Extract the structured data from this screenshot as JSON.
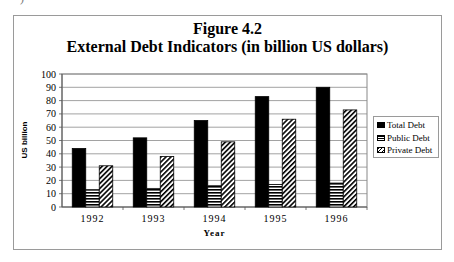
{
  "page": {
    "stray_text": ")"
  },
  "chart_data": {
    "type": "bar",
    "title": "Figure 4.2",
    "subtitle": "External Debt Indicators (in billion US dollars)",
    "xlabel": "Year",
    "ylabel": "US billion",
    "categories": [
      "1992",
      "1993",
      "1994",
      "1995",
      "1996"
    ],
    "series": [
      {
        "name": "Total Debt",
        "values": [
          44,
          52,
          65,
          83,
          90
        ],
        "pattern": "solid-black"
      },
      {
        "name": "Public Debt",
        "values": [
          13,
          14,
          16,
          17,
          18
        ],
        "pattern": "horizontal-stripes"
      },
      {
        "name": "Private Debt",
        "values": [
          31,
          38,
          49,
          66,
          73
        ],
        "pattern": "diagonal-stripes"
      }
    ],
    "ylim": [
      0,
      100
    ],
    "yticks": [
      0,
      10,
      20,
      30,
      40,
      50,
      60,
      70,
      80,
      90,
      100
    ],
    "grid": true,
    "legend_position": "right"
  }
}
